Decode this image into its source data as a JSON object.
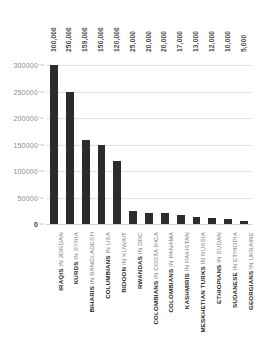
{
  "chart_data": {
    "type": "bar",
    "title": "STATELESS AND DISPLACED POPULATIONS",
    "xlabel": "",
    "ylabel": "",
    "ylim": [
      0,
      325000
    ],
    "grid": true,
    "legend": "none",
    "orientation": "vertical",
    "bar_color": "#2b2b2b",
    "categories": [
      "IRAQIS IN JORDAN",
      "KURDS IN SYRIA",
      "BIHARIS IN BANGLADESH",
      "COLUMBIANS IN USA",
      "BIDOON IN KUWAIT",
      "RWANDAS IN DRC",
      "COLOMBIANS IN COSTA RICA",
      "COLOMBIANS IN PANAMA",
      "KASHMIRIS IN PAKISTAN",
      "MESKHETIAN TURKS IN RUSSIA",
      "ETHIOPIANS IN SUDAN",
      "SUDANESE IN ETHIOPIA",
      "GEORGIANS IN UKRAINE"
    ],
    "category_parts": [
      {
        "group": "IRAQIS",
        "location": "IN JORDAN"
      },
      {
        "group": "KURDS",
        "location": "IN SYRIA"
      },
      {
        "group": "BIHARIS",
        "location": "IN BANGLADESH"
      },
      {
        "group": "COLUMBIANS",
        "location": "IN USA"
      },
      {
        "group": "BIDOON",
        "location": "IN KUWAIT"
      },
      {
        "group": "RWANDAS",
        "location": "IN DRC"
      },
      {
        "group": "COLOMBIANS",
        "location": "IN COSTA RICA"
      },
      {
        "group": "COLOMBIANS",
        "location": "IN PANAMA"
      },
      {
        "group": "KASHMIRIS",
        "location": "IN PAKISTAN"
      },
      {
        "group": "MESKHETIAN TURKS",
        "location": "IN RUSSIA"
      },
      {
        "group": "ETHIOPIANS",
        "location": "IN SUDAN"
      },
      {
        "group": "SUDANESE",
        "location": "IN ETHIOPIA"
      },
      {
        "group": "GEORGIANS",
        "location": "IN UKRAINE"
      }
    ],
    "values": [
      300000,
      250000,
      159000,
      150000,
      120000,
      25000,
      20000,
      20000,
      17000,
      13000,
      12000,
      10000,
      5000
    ],
    "value_labels": [
      "300,000",
      "250,000",
      "159,000",
      "150,000",
      "120,000",
      "25,000",
      "20,000",
      "20,000",
      "17,000",
      "13,000",
      "12,000",
      "10,000",
      "5,000"
    ],
    "y_ticks": [
      0,
      50000,
      100000,
      150000,
      200000,
      250000,
      300000
    ],
    "y_tick_labels": [
      "0",
      "50000",
      "100000",
      "150000",
      "200000",
      "250000",
      "300000"
    ]
  }
}
